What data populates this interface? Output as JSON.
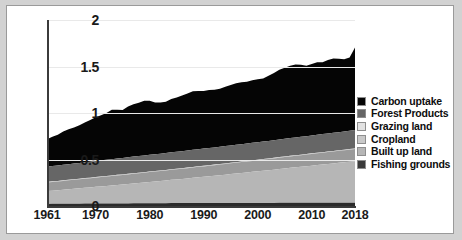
{
  "chart_data": {
    "type": "area",
    "title": "",
    "xlabel": "",
    "ylabel": "",
    "stacked": true,
    "grid": true,
    "legend_position": "right",
    "xlim": [
      1961,
      2018
    ],
    "ylim": [
      0,
      2
    ],
    "ytick_labels": [
      "0",
      "0.5",
      "1",
      "1.5",
      "2"
    ],
    "ytick_values": [
      0,
      0.5,
      1,
      1.5,
      2
    ],
    "xtick_labels": [
      "1961",
      "1970",
      "1980",
      "1990",
      "2000",
      "2010",
      "2018"
    ],
    "xtick_values": [
      1961,
      1970,
      1980,
      1990,
      2000,
      2010,
      2018
    ],
    "x": [
      1961,
      1962,
      1963,
      1964,
      1965,
      1966,
      1967,
      1968,
      1969,
      1970,
      1971,
      1972,
      1973,
      1974,
      1975,
      1976,
      1977,
      1978,
      1979,
      1980,
      1981,
      1982,
      1983,
      1984,
      1985,
      1986,
      1987,
      1988,
      1989,
      1990,
      1991,
      1992,
      1993,
      1994,
      1995,
      1996,
      1997,
      1998,
      1999,
      2000,
      2001,
      2002,
      2003,
      2004,
      2005,
      2006,
      2007,
      2008,
      2009,
      2010,
      2011,
      2012,
      2013,
      2014,
      2015,
      2016,
      2017,
      2018
    ],
    "series": [
      {
        "name": "Fishing grounds",
        "color": "#2b2b2b",
        "values": [
          0.022,
          0.023,
          0.023,
          0.024,
          0.024,
          0.025,
          0.025,
          0.026,
          0.026,
          0.027,
          0.027,
          0.027,
          0.027,
          0.028,
          0.028,
          0.028,
          0.029,
          0.029,
          0.029,
          0.03,
          0.03,
          0.03,
          0.03,
          0.031,
          0.031,
          0.031,
          0.031,
          0.032,
          0.032,
          0.032,
          0.032,
          0.032,
          0.032,
          0.032,
          0.033,
          0.033,
          0.033,
          0.033,
          0.033,
          0.033,
          0.033,
          0.033,
          0.033,
          0.034,
          0.034,
          0.034,
          0.034,
          0.034,
          0.034,
          0.034,
          0.034,
          0.034,
          0.034,
          0.034,
          0.034,
          0.034,
          0.034,
          0.034
        ]
      },
      {
        "name": "Built up land",
        "color": "#b6b6b6",
        "values": [
          0.138,
          0.142,
          0.147,
          0.151,
          0.156,
          0.16,
          0.165,
          0.17,
          0.174,
          0.179,
          0.184,
          0.189,
          0.194,
          0.199,
          0.204,
          0.209,
          0.214,
          0.219,
          0.224,
          0.229,
          0.234,
          0.239,
          0.244,
          0.25,
          0.255,
          0.26,
          0.266,
          0.271,
          0.277,
          0.282,
          0.288,
          0.293,
          0.299,
          0.305,
          0.31,
          0.316,
          0.322,
          0.328,
          0.334,
          0.34,
          0.346,
          0.352,
          0.358,
          0.364,
          0.37,
          0.376,
          0.382,
          0.388,
          0.394,
          0.4,
          0.406,
          0.412,
          0.418,
          0.424,
          0.43,
          0.436,
          0.442,
          0.448
        ]
      },
      {
        "name": "Cropland",
        "color": "#9a9a9a",
        "values": [
          0.093,
          0.094,
          0.094,
          0.095,
          0.096,
          0.096,
          0.097,
          0.098,
          0.098,
          0.099,
          0.1,
          0.1,
          0.101,
          0.102,
          0.102,
          0.103,
          0.104,
          0.104,
          0.105,
          0.106,
          0.106,
          0.107,
          0.108,
          0.108,
          0.109,
          0.11,
          0.11,
          0.111,
          0.112,
          0.112,
          0.113,
          0.114,
          0.114,
          0.115,
          0.116,
          0.116,
          0.117,
          0.118,
          0.118,
          0.119,
          0.12,
          0.12,
          0.121,
          0.122,
          0.122,
          0.123,
          0.124,
          0.124,
          0.125,
          0.126,
          0.126,
          0.127,
          0.128,
          0.128,
          0.129,
          0.13,
          0.13,
          0.131
        ]
      },
      {
        "name": "Grazing land",
        "color": "#c9c9c9",
        "values": [
          0.006,
          0.006,
          0.006,
          0.006,
          0.006,
          0.006,
          0.006,
          0.006,
          0.006,
          0.006,
          0.006,
          0.006,
          0.006,
          0.006,
          0.006,
          0.006,
          0.006,
          0.006,
          0.006,
          0.006,
          0.006,
          0.006,
          0.006,
          0.006,
          0.006,
          0.006,
          0.006,
          0.006,
          0.006,
          0.006,
          0.006,
          0.006,
          0.006,
          0.006,
          0.006,
          0.006,
          0.006,
          0.006,
          0.006,
          0.006,
          0.006,
          0.006,
          0.006,
          0.006,
          0.006,
          0.006,
          0.006,
          0.006,
          0.006,
          0.006,
          0.006,
          0.006,
          0.006,
          0.006,
          0.006,
          0.006,
          0.006,
          0.006
        ]
      },
      {
        "name": "Forest Products",
        "color": "#666666",
        "values": [
          0.163,
          0.164,
          0.165,
          0.167,
          0.168,
          0.169,
          0.17,
          0.171,
          0.172,
          0.173,
          0.174,
          0.175,
          0.176,
          0.176,
          0.177,
          0.178,
          0.178,
          0.179,
          0.18,
          0.18,
          0.18,
          0.181,
          0.181,
          0.182,
          0.182,
          0.183,
          0.183,
          0.184,
          0.184,
          0.185,
          0.185,
          0.185,
          0.186,
          0.186,
          0.186,
          0.187,
          0.187,
          0.187,
          0.188,
          0.188,
          0.188,
          0.189,
          0.189,
          0.19,
          0.19,
          0.191,
          0.191,
          0.192,
          0.192,
          0.193,
          0.193,
          0.194,
          0.194,
          0.195,
          0.195,
          0.196,
          0.196,
          0.197
        ]
      },
      {
        "name": "Carbon uptake",
        "color": "#050505",
        "values": [
          0.295,
          0.316,
          0.33,
          0.357,
          0.376,
          0.389,
          0.404,
          0.426,
          0.45,
          0.471,
          0.484,
          0.504,
          0.53,
          0.524,
          0.516,
          0.546,
          0.563,
          0.573,
          0.589,
          0.58,
          0.556,
          0.551,
          0.552,
          0.574,
          0.585,
          0.599,
          0.614,
          0.629,
          0.626,
          0.62,
          0.622,
          0.619,
          0.625,
          0.638,
          0.65,
          0.663,
          0.666,
          0.664,
          0.672,
          0.676,
          0.679,
          0.7,
          0.723,
          0.748,
          0.765,
          0.777,
          0.785,
          0.776,
          0.757,
          0.769,
          0.78,
          0.773,
          0.79,
          0.8,
          0.79,
          0.775,
          0.79,
          0.887
        ]
      }
    ],
    "legend_order": [
      "Carbon uptake",
      "Forest Products",
      "Grazing land",
      "Cropland",
      "Built up land",
      "Fishing grounds"
    ]
  },
  "legend": {
    "items": [
      {
        "label": "Carbon uptake",
        "color": "#050505"
      },
      {
        "label": "Forest Products",
        "color": "#666666"
      },
      {
        "label": "Grazing land",
        "color": "#e2e2e2"
      },
      {
        "label": "Cropland",
        "color": "#c9c9c9"
      },
      {
        "label": "Built up land",
        "color": "#b6b6b6"
      },
      {
        "label": "Fishing grounds",
        "color": "#3a3a3a"
      }
    ]
  },
  "colors": {
    "background": "#ffffff",
    "page_background": "#d2d2d2",
    "axis": "#3b3b3b",
    "gridline": "#e9e9e9",
    "text": "#1a1a1a"
  }
}
